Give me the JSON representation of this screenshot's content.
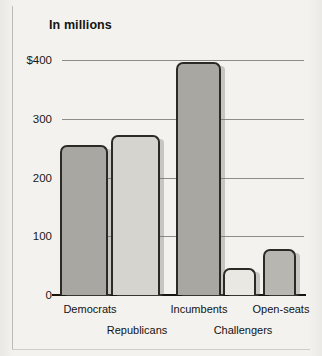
{
  "figure": {
    "title": "In millions",
    "background_color": "#f2f1ee"
  },
  "chart_data": {
    "type": "bar",
    "title": "In millions",
    "xlabel": "",
    "ylabel": "",
    "ylim": [
      0,
      400
    ],
    "yticks": [
      0,
      100,
      200,
      300,
      400
    ],
    "ytick_labels": [
      "0",
      "100",
      "200",
      "300",
      "$400"
    ],
    "grid": true,
    "legend": "none",
    "categories": [
      "Democrats",
      "Republicans",
      "Incumbents",
      "Challengers",
      "Open-seats"
    ],
    "values": [
      255,
      272,
      397,
      46,
      78
    ],
    "bar_colors": [
      "#a9a7a1",
      "#d6d4ce",
      "#a9a7a1",
      "#e9e8e3",
      "#b8b6b0"
    ],
    "bar_outline_color": "#2b2a25",
    "label_rows": [
      0,
      1,
      0,
      1,
      0
    ],
    "units": "millions of dollars"
  },
  "axis": {
    "ticks": [
      {
        "label": "$400",
        "value": 400
      },
      {
        "label": "300",
        "value": 300
      },
      {
        "label": "200",
        "value": 200
      },
      {
        "label": "100",
        "value": 100
      },
      {
        "label": "0",
        "value": 0
      }
    ]
  },
  "bars": [
    {
      "label": "Democrats",
      "value": 255,
      "color": "#a9a7a1",
      "x": 60,
      "width": 48,
      "label_row": 0,
      "label_x": 90
    },
    {
      "label": "Republicans",
      "value": 272,
      "color": "#d6d4ce",
      "x": 111,
      "width": 49,
      "label_row": 1,
      "label_x": 137
    },
    {
      "label": "Incumbents",
      "value": 397,
      "color": "#a9a7a1",
      "x": 176,
      "width": 45,
      "label_row": 0,
      "label_x": 199
    },
    {
      "label": "Challengers",
      "value": 46,
      "color": "#e9e8e3",
      "x": 223,
      "width": 33,
      "label_row": 1,
      "label_x": 243
    },
    {
      "label": "Open-seats",
      "value": 78,
      "color": "#b8b6b0",
      "x": 263,
      "width": 33,
      "label_row": 0,
      "label_x": 281
    }
  ]
}
